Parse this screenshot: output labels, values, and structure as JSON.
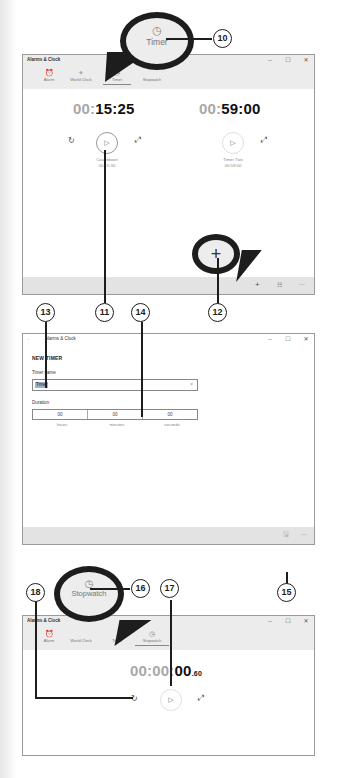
{
  "app_title": "Alarms & Clock",
  "window_controls": {
    "minimize": "–",
    "maximize": "☐",
    "close": "✕"
  },
  "tabs": [
    {
      "label": "Alarm",
      "icon": "alarm-clock-icon",
      "glyph": "⏰"
    },
    {
      "label": "World Clock",
      "icon": "world-clock-icon",
      "glyph": "⌖"
    },
    {
      "label": "Timer",
      "icon": "timer-icon",
      "glyph": "◷"
    },
    {
      "label": "Stopwatch",
      "icon": "stopwatch-icon",
      "glyph": "◷"
    }
  ],
  "timer_window": {
    "active_tab": "Timer",
    "timers": [
      {
        "dim": "00:",
        "bright": "15:25",
        "name": "Countdown",
        "set_time": "00:15:30",
        "reset_glyph": "↻",
        "play_glyph": "▷",
        "expand_glyph": "⤢"
      },
      {
        "dim": "00:",
        "bright": "59:00",
        "name": "Timer Two",
        "set_time": "00:59:00",
        "play_glyph": "▷",
        "expand_glyph": "⤢"
      }
    ],
    "appbar": {
      "add_glyph": "+",
      "select_glyph": "☷",
      "more_glyph": "···"
    }
  },
  "new_timer_window": {
    "back_glyph": "←",
    "heading": "NEW TIMER",
    "name_label": "Timer name",
    "name_value": "Timer",
    "clear_glyph": "×",
    "duration_label": "Duration",
    "duration": [
      {
        "value": "00",
        "unit": "hours"
      },
      {
        "value": "00",
        "unit": "minutes"
      },
      {
        "value": "00",
        "unit": "seconds"
      }
    ],
    "appbar": {
      "save_glyph": "🖫",
      "more_glyph": "···"
    }
  },
  "stopwatch_window": {
    "active_tab": "Stopwatch",
    "time_dim": "00:00:",
    "time_bright": "00",
    "time_fraction": ".60",
    "reset_glyph": "↻",
    "play_glyph": "▷",
    "expand_glyph": "⤢"
  },
  "callouts": {
    "timer_bubble": {
      "label": "Timer",
      "glyph": "◷"
    },
    "add_bubble": {
      "glyph": "+"
    },
    "stopwatch_bubble": {
      "label": "Stopwatch",
      "glyph": "◷"
    }
  },
  "markers": [
    "10",
    "11",
    "12",
    "13",
    "14",
    "15",
    "16",
    "17",
    "18"
  ]
}
